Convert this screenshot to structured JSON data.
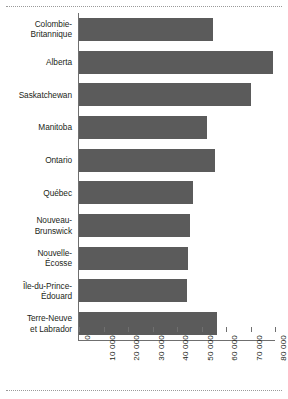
{
  "chart_data": {
    "type": "bar",
    "orientation": "horizontal",
    "title": "",
    "subtitle": "",
    "xlabel": "",
    "ylabel": "",
    "xlim": [
      0,
      80000
    ],
    "grid": false,
    "legend": null,
    "bar_color": "#5b5b5b",
    "axis_color": "#6f6f6f",
    "text_color": "#231f20",
    "xticks": [
      0,
      10000,
      20000,
      30000,
      40000,
      50000,
      60000,
      70000,
      80000
    ],
    "xtick_labels": [
      "0",
      "10 000",
      "20 000",
      "30 000",
      "40 000",
      "50 000",
      "60 000",
      "70 000",
      "80 000"
    ],
    "xtick_rotation": 90,
    "categories": [
      "Colombie-\nBritannique",
      "Alberta",
      "Saskatchewan",
      "Manitoba",
      "Ontario",
      "Québec",
      "Nouveau-\nBrunswick",
      "Nouvelle-\nÉcosse",
      "Île-du-Prince-\nÉdouard",
      "Terre-Neuve\net Labrador"
    ],
    "values": [
      54800,
      79200,
      70300,
      52400,
      55600,
      46700,
      45500,
      44300,
      43900,
      56400
    ]
  },
  "categories": [
    {
      "line1": "Colombie-",
      "line2": "Britannique"
    },
    {
      "line1": "Alberta",
      "line2": ""
    },
    {
      "line1": "Saskatchewan",
      "line2": ""
    },
    {
      "line1": "Manitoba",
      "line2": ""
    },
    {
      "line1": "Ontario",
      "line2": ""
    },
    {
      "line1": "Québec",
      "line2": ""
    },
    {
      "line1": "Nouveau-",
      "line2": "Brunswick"
    },
    {
      "line1": "Nouvelle-",
      "line2": "Écosse"
    },
    {
      "line1": "Île-du-Prince-",
      "line2": "Édouard"
    },
    {
      "line1": "Terre-Neuve",
      "line2": "et Labrador"
    }
  ]
}
